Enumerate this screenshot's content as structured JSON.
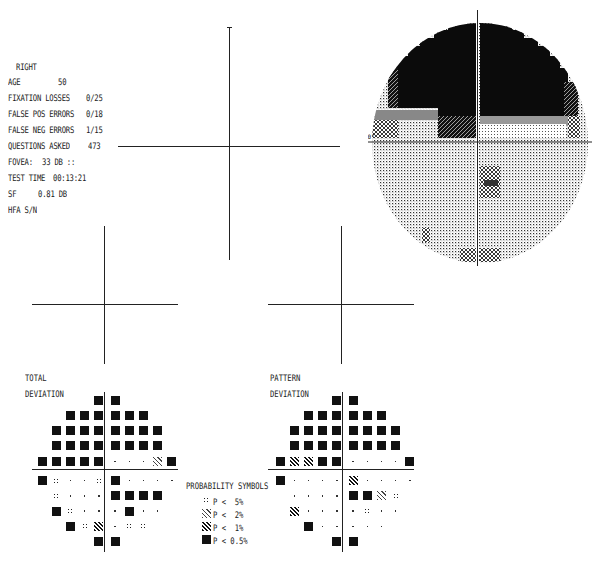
{
  "patient": {
    "eye": "RIGHT",
    "age_label": "AGE",
    "age": "50",
    "fixation_label": "FIXATION LOSSES",
    "fixation": "0/25",
    "fpos_label": "FALSE POS ERRORS",
    "fpos": "0/18",
    "fneg_label": "FALSE NEG ERRORS",
    "fneg": "1/15",
    "questions_label": "QUESTIONS ASKED",
    "questions": "473",
    "fovea_label": "FOVEA:",
    "fovea": "33 DB ::",
    "time_label": "TEST TIME",
    "time": "00:13:21",
    "sf_label": "SF",
    "sf": "0.81 DB",
    "hfa_label": "HFA S/N"
  },
  "threshold": {
    "rows": [
      [
        null,
        null,
        null,
        null,
        "<0",
        "<0",
        null,
        null,
        null,
        null
      ],
      [
        null,
        null,
        "<0",
        "<0",
        "<0",
        "<0",
        "<0",
        "<0",
        null,
        null
      ],
      [
        null,
        "<0",
        "<0",
        "<0\n(<0)",
        "<0",
        "<0",
        "<0\n(<0)",
        "<0",
        "<0",
        null
      ],
      [
        null,
        "<0",
        "<0",
        "<0\n(<0)",
        "<0",
        "<0",
        "<0\n(<0)",
        "<0",
        "<0",
        null
      ],
      [
        "18\n(18)",
        "24\n(24)",
        "22\n(26)",
        "2",
        "<0",
        "30\n(30)",
        "30\n(32)",
        "32\n(32)",
        "24\n(28)",
        "6\n(2)"
      ],
      [
        "22\n(24)",
        "27\n(29)",
        "31",
        "33",
        "28\n(28)",
        "24",
        "31\n(29)",
        "31\n(31)",
        "31\n(29)",
        "30"
      ],
      [
        null,
        "28",
        "33",
        "33\n(33)",
        "31",
        "1\n(7)",
        "25\n(23)",
        "25",
        "24\n(26)",
        null
      ],
      [
        null,
        "22\n(26)",
        "28\n(28)",
        "31\n(31)",
        "31",
        "31\n(31)",
        "27\n(25)",
        "30\n(30)",
        "30",
        null
      ],
      [
        null,
        null,
        "18\n(22)",
        "28",
        "26",
        "25",
        "28",
        "28",
        null,
        null
      ],
      [
        null,
        null,
        null,
        null,
        "17\n(15)",
        "20\n(18)",
        null,
        null,
        null,
        null
      ]
    ]
  },
  "total_deviation": {
    "label1": "TOTAL",
    "label2": "DEVIATION",
    "rows": [
      [
        null,
        null,
        null,
        null,
        "-33",
        "-33",
        null,
        null,
        null,
        null
      ],
      [
        null,
        null,
        "-33",
        "-33",
        "-33",
        "-33",
        "-33",
        "-33",
        null,
        null
      ],
      [
        null,
        "-34",
        "-34",
        "-34",
        "-34",
        "-34",
        "-33",
        "-33",
        "-33",
        null
      ],
      [
        null,
        "-34",
        "-34",
        "-34",
        "-34",
        "-34",
        "-34",
        "-34",
        "-33",
        null
      ],
      [
        "-14",
        "-8",
        "-8",
        "-30",
        "-34",
        "-2",
        "-1",
        "0",
        "-5",
        "-27"
      ],
      [
        "-9",
        "-4",
        "-1",
        "1",
        "-4",
        "-8",
        "-2",
        "-1",
        "-2",
        "-1"
      ],
      [
        null,
        "-4",
        "1",
        "1",
        "-1",
        "-28",
        "-8",
        "-7",
        "-7",
        null
      ],
      [
        null,
        "-8",
        "-4",
        "-1",
        "-1",
        "-1",
        "-6",
        "-2",
        "-2",
        null
      ],
      [
        null,
        null,
        "-12",
        "-4",
        "-6",
        "-3",
        "-4",
        "-4",
        null,
        null
      ],
      [
        null,
        null,
        null,
        null,
        "-16",
        "-13",
        null,
        null,
        null,
        null
      ]
    ],
    "symbols": [
      [
        null,
        null,
        null,
        null,
        "B",
        "B",
        null,
        null,
        null,
        null
      ],
      [
        null,
        null,
        "B",
        "B",
        "B",
        "B",
        "B",
        "B",
        null,
        null
      ],
      [
        null,
        "B",
        "B",
        "B",
        "B",
        "B",
        "B",
        "B",
        "B",
        null
      ],
      [
        null,
        "B",
        "B",
        "B",
        "B",
        "B",
        "B",
        "B",
        "B",
        null
      ],
      [
        "B",
        "B",
        "B",
        "B",
        "B",
        ".",
        ".",
        ".",
        "P2",
        "B"
      ],
      [
        "B",
        "P5",
        ".",
        ".",
        "P5",
        "B",
        ".",
        ".",
        ".",
        "."
      ],
      [
        null,
        "P5",
        ".",
        ".",
        ".",
        "B",
        "B",
        "B",
        "B",
        null
      ],
      [
        null,
        "B",
        "P5",
        ".",
        ".",
        ".",
        "B",
        ".",
        ".",
        null
      ],
      [
        null,
        null,
        "B",
        "P5",
        "P1",
        ".",
        "P5",
        "P5",
        null,
        null
      ],
      [
        null,
        null,
        null,
        null,
        "B",
        "B",
        null,
        null,
        null,
        null
      ]
    ]
  },
  "pattern_deviation": {
    "label1": "PATTERN",
    "label2": "DEVIATION",
    "rows": [
      [
        null,
        null,
        null,
        null,
        "-32",
        "-31",
        null,
        null,
        null,
        null
      ],
      [
        null,
        null,
        "-32",
        "-32",
        "-32",
        "-32",
        "-32",
        "-31",
        null,
        null
      ],
      [
        null,
        "-32",
        "-32",
        "-33",
        "-32",
        "-32",
        "-32",
        "-32",
        "-32",
        null
      ],
      [
        null,
        "-33",
        "-33",
        "-33",
        "-33",
        "-33",
        "-33",
        "-32",
        "-32",
        null
      ],
      [
        "-13",
        "-7",
        "-7",
        "-29",
        "-33",
        "-1",
        "0",
        "2",
        "-4",
        "-26"
      ],
      [
        "-8",
        "-3",
        "0",
        "2",
        "-3",
        "-7",
        "-1",
        "0",
        "0",
        "0"
      ],
      [
        null,
        "-3",
        "2",
        "2",
        "0",
        "-27",
        "-7",
        "-6",
        "-6",
        null
      ],
      [
        null,
        "-7",
        "-3",
        "0",
        "0",
        "0",
        "-5",
        "-1",
        "0",
        null
      ],
      [
        null,
        null,
        "-11",
        "-3",
        "-5",
        "-2",
        "-3",
        "-2",
        null,
        null
      ],
      [
        null,
        null,
        null,
        null,
        "-14",
        "-11",
        null,
        null,
        null,
        null
      ]
    ],
    "symbols": [
      [
        null,
        null,
        null,
        null,
        "B",
        "B",
        null,
        null,
        null,
        null
      ],
      [
        null,
        null,
        "B",
        "B",
        "B",
        "B",
        "B",
        "B",
        null,
        null
      ],
      [
        null,
        "B",
        "B",
        "B",
        "B",
        "B",
        "B",
        "B",
        "B",
        null
      ],
      [
        null,
        "B",
        "B",
        "B",
        "B",
        "B",
        "B",
        "B",
        "B",
        null
      ],
      [
        "B",
        "P1",
        "P1",
        "B",
        "B",
        ".",
        ".",
        ".",
        ".",
        "B"
      ],
      [
        "B",
        ".",
        ".",
        ".",
        ".",
        "P1",
        ".",
        ".",
        ".",
        "."
      ],
      [
        null,
        ".",
        ".",
        ".",
        ".",
        "B",
        "B",
        "P2",
        "P5",
        null
      ],
      [
        null,
        "P1",
        ".",
        ".",
        ".",
        ".",
        "P5",
        ".",
        ".",
        null
      ],
      [
        null,
        null,
        "B",
        ".",
        ".",
        ".",
        ".",
        ".",
        null,
        null
      ],
      [
        null,
        null,
        null,
        null,
        "B",
        "B",
        null,
        null,
        null,
        null
      ]
    ]
  },
  "legend": {
    "title": "PROBABILITY SYMBOLS",
    "items": [
      {
        "sym": "P5",
        "text": "P <  5%"
      },
      {
        "sym": "P2",
        "text": "P <  2%"
      },
      {
        "sym": "P1",
        "text": "P <  1%"
      },
      {
        "sym": "B",
        "text": "P < 0.5%"
      }
    ]
  },
  "grayscale": {
    "scale_label": "10°"
  }
}
